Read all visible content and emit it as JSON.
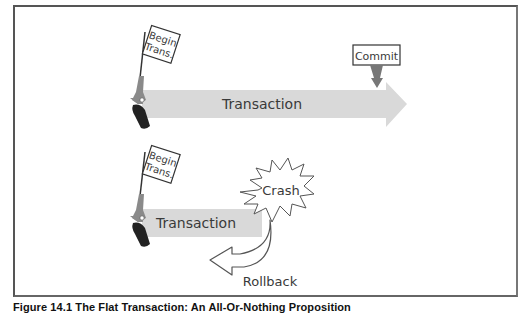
{
  "figure": {
    "caption": "Figure 14.1  The Flat Transaction: An All-Or-Nothing Proposition",
    "colors": {
      "frame": "#555555",
      "arrow_fill": "#d9d9d9",
      "gun_gray": "#8a8a8a",
      "gun_grip": "#222222",
      "commit_marker": "#777777",
      "text": "#3a3a3a"
    }
  },
  "scenario_commit": {
    "start_flag": {
      "line1": "Begin",
      "line2": "Trans."
    },
    "arrow_label": "Transaction",
    "end_flag": {
      "label": "Commit"
    }
  },
  "scenario_rollback": {
    "start_flag": {
      "line1": "Begin",
      "line2": "Trans."
    },
    "arrow_label": "Transaction",
    "crash_label": "Crash",
    "rollback_label": "Rollback"
  }
}
